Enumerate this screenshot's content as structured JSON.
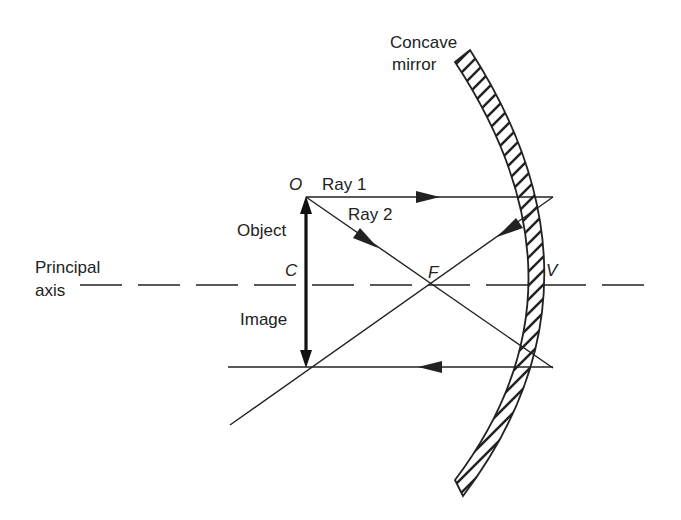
{
  "diagram": {
    "labels": {
      "mirror_line1": "Concave",
      "mirror_line2": "mirror",
      "point_o": "O",
      "point_c": "C",
      "point_f": "F",
      "point_v": "V",
      "ray1": "Ray 1",
      "ray2": "Ray 2",
      "object": "Object",
      "image": "Image",
      "axis_line1": "Principal",
      "axis_line2": "axis"
    },
    "colors": {
      "stroke": "#222222",
      "background": "#ffffff"
    }
  }
}
